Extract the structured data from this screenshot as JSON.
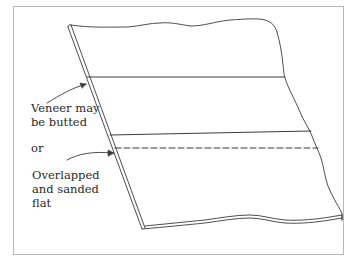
{
  "diagram": {
    "title": "",
    "labels": {
      "butted": {
        "line1": "Veneer may",
        "line2": "be butted"
      },
      "or": "or",
      "overlapped": {
        "line1": "Overlapped",
        "line2": "and sanded",
        "line3": "flat"
      }
    },
    "elements": [
      {
        "id": "board",
        "type": "parallelogram-panel",
        "description": "thin board with torn/wavy top, right and bottom edges"
      },
      {
        "id": "seam-butted",
        "type": "solid-line",
        "description": "butt joint between veneer sheets"
      },
      {
        "id": "seam-upper",
        "type": "solid-line",
        "description": "upper edge of overlap region"
      },
      {
        "id": "seam-overlap",
        "type": "dashed-line",
        "description": "overlapped veneer edge"
      },
      {
        "id": "arrow-butted",
        "type": "leader-arrow",
        "target": "seam-butted"
      },
      {
        "id": "arrow-overlap",
        "type": "leader-arrow",
        "target": "seam-overlap"
      }
    ],
    "colors": {
      "line": "#3a3a3a",
      "frame": "#b8b8b8",
      "text": "#2a2a2a",
      "background": "#ffffff"
    }
  }
}
